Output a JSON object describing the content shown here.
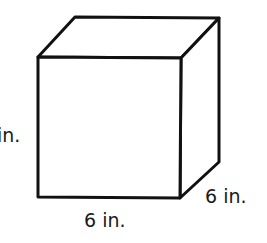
{
  "figure": {
    "shape": "cube",
    "labels": {
      "height": "6 in.",
      "height_visible": "in.",
      "width": "6 in.",
      "depth": "6 in."
    },
    "stroke_color": "#111111",
    "fill_color": "#ffffff"
  }
}
